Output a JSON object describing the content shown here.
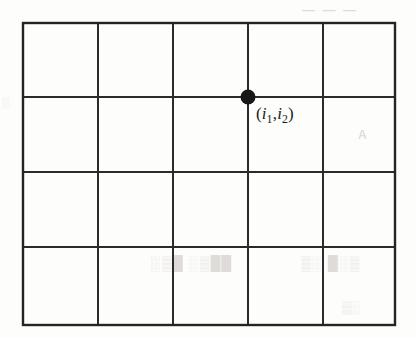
{
  "figure": {
    "kind": "lattice-grid-diagram",
    "background_color": "#fdfdfc",
    "line_color": "#2b2b2b",
    "dot_color": "#171717"
  },
  "grid": {
    "columns": 5,
    "rows": 4,
    "x_positions": [
      23,
      98,
      173,
      248,
      323,
      395
    ],
    "y_positions": [
      23,
      97,
      172,
      247,
      325
    ],
    "left": 23,
    "top": 23,
    "right": 395,
    "bottom": 325
  },
  "node": {
    "center_x": 248,
    "center_y": 97,
    "radius": 7.5,
    "label": {
      "full_text": "(i1,i2)",
      "open_paren": "(",
      "var1": "i",
      "sub1": "1",
      "comma": ",",
      "var2": "i",
      "sub2": "2",
      "close_paren": ")"
    }
  },
  "artifacts": {
    "bleed_top": "— — —",
    "bleed_mid": "A",
    "bleed_low": "██▒░ █▒░",
    "bleed_low_right": "▒░█ ░▒",
    "bleed_bottom": "░▒",
    "bleed_top_left": "░"
  }
}
